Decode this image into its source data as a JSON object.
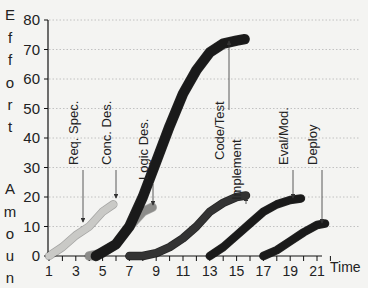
{
  "chart_data": {
    "type": "line",
    "title": "",
    "xlabel": "Time",
    "ylabel": "Effort Amount",
    "ylabel_letters": [
      "E",
      "f",
      "f",
      "o",
      "r",
      "t",
      "",
      "A",
      "m",
      "o",
      "u",
      "n",
      "t"
    ],
    "xlim": [
      1,
      22
    ],
    "ylim": [
      0,
      80
    ],
    "x_ticks": [
      1,
      3,
      5,
      7,
      9,
      11,
      13,
      15,
      17,
      19,
      21
    ],
    "y_ticks": [
      0,
      10,
      20,
      30,
      40,
      50,
      60,
      70,
      80
    ],
    "grid": "horizontal dotted",
    "legend": "none (annotations with arrows)",
    "series": [
      {
        "name": "Req. Spec.",
        "color": "#c9c9c6",
        "x": [
          1,
          2,
          3,
          4,
          5,
          5.8
        ],
        "values": [
          0,
          3,
          7,
          10,
          15,
          17.5
        ]
      },
      {
        "name": "Conc. Des.",
        "color": "#8c8c8a",
        "x": [
          4,
          5,
          6,
          7,
          8,
          8.7
        ],
        "values": [
          0,
          1,
          4,
          10,
          15,
          16.5
        ]
      },
      {
        "name": "Logic Des.",
        "color": "#1a1a1a",
        "x": [
          4.5,
          6,
          7,
          8,
          9,
          10,
          11,
          12,
          13,
          14,
          15,
          15.6
        ],
        "values": [
          0,
          4,
          10,
          20,
          32,
          44,
          55,
          63,
          69,
          72,
          73,
          73.5
        ]
      },
      {
        "name": "Code/Test Implement",
        "color": "#333333",
        "x": [
          7,
          8,
          9,
          10,
          11,
          12,
          13,
          14,
          15,
          15.7
        ],
        "values": [
          0,
          0,
          1,
          3,
          6,
          10,
          15,
          18,
          20,
          20.5
        ]
      },
      {
        "name": "Eval/Mod.",
        "color": "#1a1a1a",
        "x": [
          13,
          14,
          15,
          16,
          17,
          18,
          19,
          19.8
        ],
        "values": [
          0,
          3,
          7,
          11,
          15,
          17.5,
          19,
          19.5
        ]
      },
      {
        "name": "Deploy",
        "color": "#1a1a1a",
        "x": [
          17,
          18,
          19,
          20,
          21,
          21.6
        ],
        "values": [
          0,
          2,
          5,
          8,
          10.5,
          11
        ]
      }
    ],
    "annotations": [
      {
        "text": "Req. Spec.",
        "points_to": [
          3.5,
          8
        ]
      },
      {
        "text": "Conc. Des.",
        "points_to": [
          5.5,
          15
        ]
      },
      {
        "text": "Logic Des.",
        "points_to": [
          8.5,
          16
        ]
      },
      {
        "text": "Code/Test",
        "points_to": [
          15.5,
          73
        ]
      },
      {
        "text": "Implement",
        "points_to": [
          15.5,
          20
        ]
      },
      {
        "text": "Eval/Mod.",
        "points_to": [
          19.5,
          19
        ]
      },
      {
        "text": "Deploy",
        "points_to": [
          21.4,
          11
        ]
      }
    ]
  }
}
